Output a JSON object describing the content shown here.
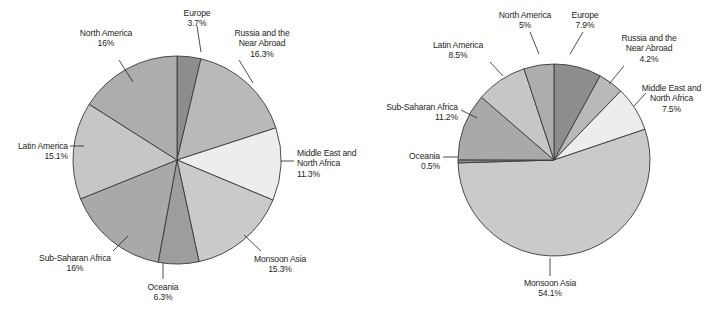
{
  "chart_data": [
    {
      "type": "pie",
      "title": "",
      "chart_index": 0,
      "position": "left",
      "legend": "labels-with-leader-lines",
      "start_angle_deg": 0,
      "direction": "clockwise",
      "labels": [
        "Europe",
        "Russia and the Near Abroad",
        "Middle East and North Africa",
        "Monsoon Asia",
        "Oceania",
        "Sub-Saharan Africa",
        "Latin America",
        "North America"
      ],
      "values": [
        3.7,
        16.3,
        11.3,
        15.3,
        6.3,
        16,
        15.1,
        16
      ],
      "value_labels": [
        "3.7%",
        "16.3%",
        "11.3%",
        "15.3%",
        "6.3%",
        "16%",
        "15.1%",
        "16%"
      ],
      "colors": [
        "#8d8d8d",
        "#b9b9b9",
        "#ededed",
        "#cacaca",
        "#9d9d9d",
        "#a9a9a9",
        "#c6c6c6",
        "#adadad"
      ],
      "slices": [
        {
          "name": "Europe",
          "pct": 3.7,
          "pct_label": "3.7%",
          "color": "#8d8d8d",
          "name_lines": [
            "Europe"
          ],
          "align": "center",
          "label_x": 166,
          "label_y": 8,
          "label_w": 62,
          "leader": [
            [
              197,
              26
            ],
            [
              201,
              52
            ]
          ]
        },
        {
          "name": "Russia and the Near Abroad",
          "pct": 16.3,
          "pct_label": "16.3%",
          "color": "#b9b9b9",
          "name_lines": [
            "Russia and the",
            "Near Abroad"
          ],
          "align": "center",
          "label_x": 223,
          "label_y": 28,
          "label_w": 78,
          "leader": [
            [
              239,
              60
            ],
            [
              253,
              83
            ]
          ]
        },
        {
          "name": "Middle East and North Africa",
          "pct": 11.3,
          "pct_label": "11.3%",
          "color": "#ededed",
          "name_lines": [
            "Middle East and",
            "North Africa"
          ],
          "align": "left",
          "label_x": 297,
          "label_y": 148,
          "label_w": 84,
          "leader": [
            [
              281,
              161
            ],
            [
              294,
              161
            ]
          ]
        },
        {
          "name": "Monsoon Asia",
          "pct": 15.3,
          "pct_label": "15.3%",
          "color": "#cacaca",
          "name_lines": [
            "Monsoon Asia"
          ],
          "align": "center",
          "label_x": 247,
          "label_y": 254,
          "label_w": 66,
          "leader": [
            [
              261,
              251
            ],
            [
              244,
              235
            ]
          ]
        },
        {
          "name": "Oceania",
          "pct": 6.3,
          "pct_label": "6.3%",
          "color": "#9d9d9d",
          "name_lines": [
            "Oceania"
          ],
          "align": "center",
          "label_x": 136,
          "label_y": 282,
          "label_w": 54,
          "leader": [
            [
              163,
              279
            ],
            [
              163,
              263
            ]
          ]
        },
        {
          "name": "Sub-Saharan Africa",
          "pct": 16,
          "pct_label": "16%",
          "color": "#a9a9a9",
          "name_lines": [
            "Sub-Saharan Africa"
          ],
          "align": "center",
          "label_x": 30,
          "label_y": 253,
          "label_w": 90,
          "leader": [
            [
              113,
              251
            ],
            [
              128,
              236
            ]
          ]
        },
        {
          "name": "Latin America",
          "pct": 15.1,
          "pct_label": "15.1%",
          "color": "#c6c6c6",
          "name_lines": [
            "Latin America"
          ],
          "align": "right",
          "label_x": 6,
          "label_y": 141,
          "label_w": 62,
          "leader": [
            [
              70,
              146
            ],
            [
              84,
              146
            ]
          ]
        },
        {
          "name": "North America",
          "pct": 16,
          "pct_label": "16%",
          "color": "#adadad",
          "name_lines": [
            "North America"
          ],
          "align": "center",
          "label_x": 68,
          "label_y": 28,
          "label_w": 76,
          "leader": [
            [
              119,
              60
            ],
            [
              133,
              82
            ]
          ]
        }
      ]
    },
    {
      "type": "pie",
      "title": "",
      "chart_index": 1,
      "position": "right",
      "legend": "labels-with-leader-lines",
      "start_angle_deg": 0,
      "direction": "clockwise",
      "labels": [
        "Europe",
        "Russia and the Near Abroad",
        "Middle East and North Africa",
        "Monsoon Asia",
        "Oceania",
        "Sub-Saharan Africa",
        "Latin America",
        "North America"
      ],
      "values": [
        7.9,
        4.2,
        7.5,
        54.1,
        0.5,
        11.2,
        8.5,
        5
      ],
      "value_labels": [
        "7.9%",
        "4.2%",
        "7.5%",
        "54.1%",
        "0.5%",
        "11.2%",
        "8.5%",
        "5%"
      ],
      "colors": [
        "#8d8d8d",
        "#b9b9b9",
        "#ededed",
        "#cacaca",
        "#8d8d8d",
        "#a9a9a9",
        "#c6c6c6",
        "#adadad"
      ],
      "slices": [
        {
          "name": "Europe",
          "pct": 7.9,
          "pct_label": "7.9%",
          "color": "#8d8d8d",
          "name_lines": [
            "Europe"
          ],
          "align": "center",
          "label_x": 557,
          "label_y": 10,
          "label_w": 56,
          "leader": [
            [
              583,
              32
            ],
            [
              570,
              54
            ]
          ]
        },
        {
          "name": "Russia and the Near Abroad",
          "pct": 4.2,
          "pct_label": "4.2%",
          "color": "#b9b9b9",
          "name_lines": [
            "Russia and the",
            "Near Abroad"
          ],
          "align": "center",
          "label_x": 610,
          "label_y": 33,
          "label_w": 78,
          "leader": [
            [
              624,
              66
            ],
            [
              609,
              84
            ]
          ]
        },
        {
          "name": "Middle East and North Africa",
          "pct": 7.5,
          "pct_label": "7.5%",
          "color": "#ededed",
          "name_lines": [
            "Middle East and",
            "North Africa"
          ],
          "align": "center",
          "label_x": 634,
          "label_y": 83,
          "label_w": 75,
          "leader": [
            [
              646,
              93
            ],
            [
              634,
              106
            ]
          ]
        },
        {
          "name": "Monsoon Asia",
          "pct": 54.1,
          "pct_label": "54.1%",
          "color": "#cacaca",
          "name_lines": [
            "Monsoon Asia"
          ],
          "align": "center",
          "label_x": 510,
          "label_y": 278,
          "label_w": 80,
          "leader": [
            [
              550,
              276
            ],
            [
              550,
              258
            ]
          ]
        },
        {
          "name": "Oceania",
          "pct": 0.5,
          "pct_label": "0.5%",
          "color": "#8d8d8d",
          "name_lines": [
            "Oceania"
          ],
          "align": "right",
          "label_x": 390,
          "label_y": 151,
          "label_w": 50,
          "leader": [
            [
              443,
              157
            ],
            [
              459,
              157
            ]
          ]
        },
        {
          "name": "Sub-Saharan Africa",
          "pct": 11.2,
          "pct_label": "11.2%",
          "color": "#a9a9a9",
          "name_lines": [
            "Sub-Saharan Africa"
          ],
          "align": "right",
          "label_x": 368,
          "label_y": 102,
          "label_w": 90,
          "leader": [
            [
              461,
              110
            ],
            [
              477,
              118
            ]
          ]
        },
        {
          "name": "Latin America",
          "pct": 8.5,
          "pct_label": "8.5%",
          "color": "#c6c6c6",
          "name_lines": [
            "Latin America"
          ],
          "align": "center",
          "label_x": 420,
          "label_y": 40,
          "label_w": 76,
          "leader": [
            [
              490,
              62
            ],
            [
              503,
              76
            ]
          ]
        },
        {
          "name": "North America",
          "pct": 5,
          "pct_label": "5%",
          "color": "#adadad",
          "name_lines": [
            "North America"
          ],
          "align": "center",
          "label_x": 487,
          "label_y": 10,
          "label_w": 76,
          "leader": [
            [
              530,
              32
            ],
            [
              539,
              54
            ]
          ]
        }
      ]
    }
  ],
  "geometry": {
    "left_pie": {
      "cx": 177,
      "cy": 160,
      "r": 104
    },
    "right_pie": {
      "cx": 554,
      "cy": 160,
      "r": 96
    }
  },
  "style": {
    "stroke": "#3a3a3a",
    "background": "#ffffff",
    "text_color": "#231f20"
  }
}
